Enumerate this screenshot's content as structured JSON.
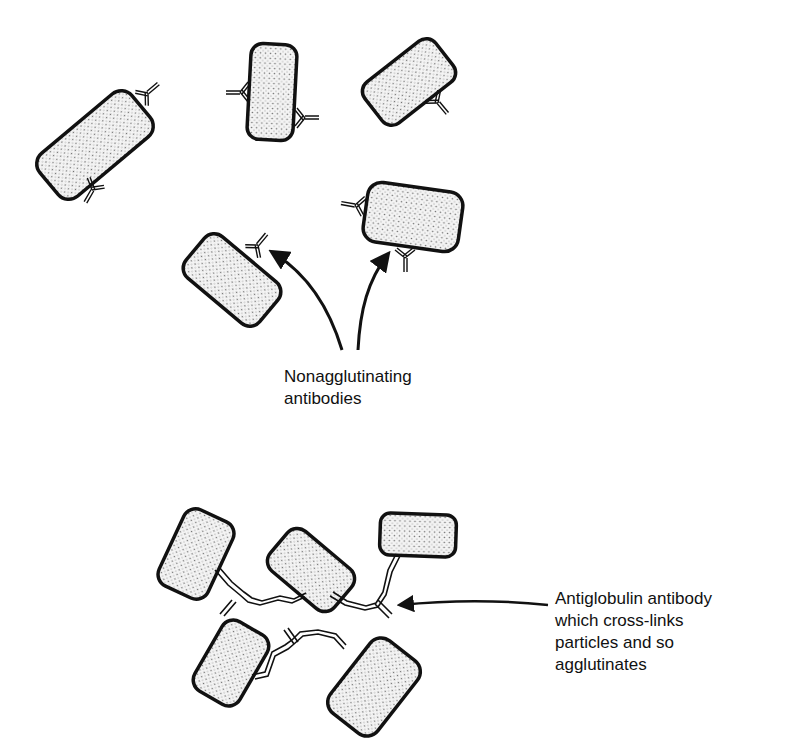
{
  "diagram": {
    "type": "antiglobulin-agglutination-illustration",
    "colors": {
      "outline": "#111111",
      "fill": "#f2f2f2",
      "dots": "#7a7a7a",
      "background": "#ffffff"
    },
    "top_panel": {
      "label": "Nonagglutinating\nantibodies",
      "label_lines": [
        "Nonagglutinating",
        "antibodies"
      ],
      "particles": [
        {
          "id": "p1",
          "cx": 95,
          "cy": 145,
          "w": 120,
          "h": 56,
          "rotate": -40
        },
        {
          "id": "p2",
          "cx": 272,
          "cy": 92,
          "w": 46,
          "h": 96,
          "rotate": 3
        },
        {
          "id": "p3",
          "cx": 409,
          "cy": 82,
          "w": 90,
          "h": 52,
          "rotate": -38
        },
        {
          "id": "p4",
          "cx": 232,
          "cy": 280,
          "w": 96,
          "h": 54,
          "rotate": 40
        },
        {
          "id": "p5",
          "cx": 413,
          "cy": 217,
          "w": 96,
          "h": 60,
          "rotate": 8
        }
      ],
      "arrows": [
        {
          "from": [
            343,
            352
          ],
          "to": [
            268,
            252
          ]
        },
        {
          "from": [
            358,
            352
          ],
          "to": [
            388,
            252
          ]
        }
      ]
    },
    "bottom_panel": {
      "label": "Antiglobulin antibody\nwhich cross-links\nparticles and so\nagglutinates",
      "label_lines": [
        "Antiglobulin antibody",
        "which cross-links",
        "particles and so",
        "agglutinates"
      ],
      "particles": [
        {
          "id": "b1",
          "cx": 196,
          "cy": 554,
          "w": 54,
          "h": 84,
          "rotate": 25
        },
        {
          "id": "b2",
          "cx": 311,
          "cy": 570,
          "w": 84,
          "h": 52,
          "rotate": 40
        },
        {
          "id": "b3",
          "cx": 418,
          "cy": 535,
          "w": 76,
          "h": 42,
          "rotate": 2
        },
        {
          "id": "b4",
          "cx": 231,
          "cy": 663,
          "w": 52,
          "h": 80,
          "rotate": 30
        },
        {
          "id": "b5",
          "cx": 374,
          "cy": 687,
          "w": 60,
          "h": 92,
          "rotate": 38
        }
      ],
      "arrow": {
        "from": [
          548,
          603
        ],
        "to": [
          398,
          603
        ]
      }
    }
  }
}
